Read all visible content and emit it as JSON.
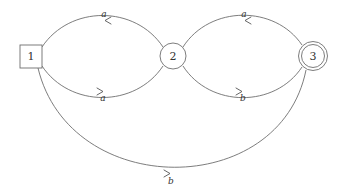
{
  "diagram": {
    "type": "finite-automaton",
    "nodes": [
      {
        "id": "1",
        "label": "1",
        "shape": "square",
        "role": "initial"
      },
      {
        "id": "2",
        "label": "2",
        "shape": "circle",
        "role": "normal"
      },
      {
        "id": "3",
        "label": "3",
        "shape": "double-circle",
        "role": "accepting"
      }
    ],
    "edges": [
      {
        "from": "2",
        "to": "1",
        "label": "a",
        "route": "top"
      },
      {
        "from": "1",
        "to": "2",
        "label": "a",
        "route": "bottom"
      },
      {
        "from": "3",
        "to": "2",
        "label": "a",
        "route": "top"
      },
      {
        "from": "2",
        "to": "3",
        "label": "b",
        "route": "bottom"
      },
      {
        "from": "1",
        "to": "3",
        "label": "b",
        "route": "outer-bottom"
      }
    ],
    "colors": {
      "stroke": "#6e6e6e",
      "text": "#333333",
      "background": "#ffffff"
    }
  }
}
